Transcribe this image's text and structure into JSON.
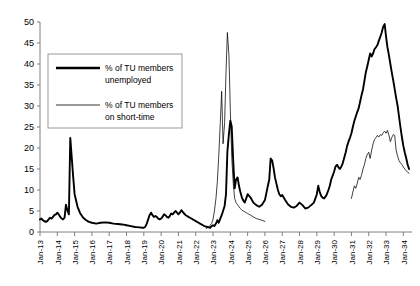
{
  "chart_data": {
    "type": "line",
    "title": "",
    "xlabel": "",
    "ylabel": "",
    "ylim": [
      0,
      50
    ],
    "ytick_step": 5,
    "grid": false,
    "legend_position": "upper-left-inside",
    "ytick_labels": [
      "0",
      "5",
      "10",
      "15",
      "20",
      "25",
      "30",
      "35",
      "40",
      "45",
      "50"
    ],
    "xtick_labels": [
      "Jan-13",
      "Jan-14",
      "Jan-15",
      "Jan-16",
      "Jan-17",
      "Jan-18",
      "Jan-19",
      "Jan-20",
      "Jan-21",
      "Jan-22",
      "Jan-23",
      "Jan-24",
      "Jan-25",
      "Jan-26",
      "Jan-27",
      "Jan-28",
      "Jan-29",
      "Jan-30",
      "Jan-31",
      "Jan-32",
      "Jan-33",
      "Jan-34"
    ],
    "x_start": 1913.0,
    "x_end": 1934.5,
    "series": [
      {
        "name": "% of TU members unemployed",
        "style": "thick",
        "color": "#000000",
        "x": [
          1913.0,
          1913.08,
          1913.17,
          1913.25,
          1913.33,
          1913.42,
          1913.5,
          1913.58,
          1913.67,
          1913.75,
          1913.83,
          1913.92,
          1914.0,
          1914.08,
          1914.17,
          1914.25,
          1914.33,
          1914.42,
          1914.5,
          1914.58,
          1914.67,
          1914.75,
          1914.83,
          1914.92,
          1915.0,
          1915.17,
          1915.33,
          1915.5,
          1915.67,
          1915.83,
          1916.0,
          1916.25,
          1916.5,
          1916.75,
          1917.0,
          1917.25,
          1917.5,
          1917.75,
          1918.0,
          1918.25,
          1918.5,
          1918.75,
          1918.92,
          1919.0,
          1919.08,
          1919.17,
          1919.25,
          1919.33,
          1919.42,
          1919.5,
          1919.58,
          1919.67,
          1919.75,
          1919.83,
          1919.92,
          1920.0,
          1920.08,
          1920.17,
          1920.25,
          1920.33,
          1920.42,
          1920.5,
          1920.58,
          1920.67,
          1920.75,
          1920.83,
          1920.92,
          1921.0,
          1921.08,
          1921.17,
          1921.25,
          1921.33,
          1921.42,
          1921.5,
          1921.58,
          1921.67,
          1921.75,
          1921.83,
          1921.92,
          1922.0,
          1922.08,
          1922.17,
          1922.25,
          1922.33,
          1922.42,
          1922.5,
          1922.58,
          1922.67,
          1922.75,
          1922.83,
          1922.92,
          1923.0,
          1923.08,
          1923.17,
          1923.25,
          1923.33,
          1923.42,
          1923.5,
          1923.58,
          1923.67,
          1923.75,
          1923.83,
          1923.92,
          1924.0,
          1924.08,
          1924.17,
          1924.25,
          1924.33,
          1924.42,
          1924.5,
          1924.58,
          1924.67,
          1924.75,
          1924.83,
          1924.92,
          1925.0,
          1925.17,
          1925.33,
          1925.5,
          1925.67,
          1925.83,
          1926.0,
          1926.08,
          1926.17,
          1926.25,
          1926.33,
          1926.42,
          1926.5,
          1926.58,
          1926.67,
          1926.75,
          1926.83,
          1926.92,
          1927.0,
          1927.17,
          1927.33,
          1927.5,
          1927.67,
          1927.83,
          1928.0,
          1928.17,
          1928.33,
          1928.5,
          1928.67,
          1928.83,
          1929.0,
          1929.08,
          1929.17,
          1929.25,
          1929.33,
          1929.42,
          1929.5,
          1929.58,
          1929.67,
          1929.75,
          1929.83,
          1929.92,
          1930.0,
          1930.08,
          1930.17,
          1930.25,
          1930.33,
          1930.42,
          1930.5,
          1930.58,
          1930.67,
          1930.75,
          1930.83,
          1930.92,
          1931.0,
          1931.08,
          1931.17,
          1931.25,
          1931.33,
          1931.42,
          1931.5,
          1931.58,
          1931.67,
          1931.75,
          1931.83,
          1931.92,
          1932.0,
          1932.08,
          1932.17,
          1932.25,
          1932.33,
          1932.42,
          1932.5,
          1932.58,
          1932.67,
          1932.75,
          1932.83,
          1932.92,
          1933.0,
          1933.08,
          1933.17,
          1933.25,
          1933.33,
          1933.42,
          1933.5,
          1933.58,
          1933.67,
          1933.75,
          1933.83,
          1933.92,
          1934.0,
          1934.08,
          1934.17,
          1934.25,
          1934.33
        ],
        "values": [
          3.0,
          3.2,
          2.8,
          2.6,
          2.4,
          2.6,
          3.0,
          3.4,
          3.2,
          3.6,
          4.0,
          4.2,
          4.6,
          4.2,
          3.6,
          3.2,
          3.0,
          3.4,
          6.5,
          5.2,
          4.2,
          22.4,
          18.0,
          13.0,
          9.0,
          6.0,
          4.4,
          3.4,
          2.8,
          2.4,
          2.2,
          2.0,
          2.2,
          2.3,
          2.2,
          2.0,
          1.9,
          1.8,
          1.6,
          1.4,
          1.2,
          1.1,
          1.0,
          1.0,
          1.2,
          2.0,
          3.0,
          4.0,
          4.6,
          4.0,
          3.6,
          3.8,
          3.6,
          3.2,
          3.0,
          3.2,
          3.6,
          4.2,
          4.0,
          3.6,
          3.4,
          3.8,
          4.4,
          4.2,
          4.6,
          5.0,
          4.6,
          4.2,
          4.6,
          5.2,
          4.8,
          4.4,
          4.0,
          3.8,
          3.6,
          3.4,
          3.2,
          3.0,
          2.8,
          2.6,
          2.4,
          2.2,
          2.0,
          1.8,
          1.6,
          1.4,
          1.3,
          1.2,
          1.1,
          1.0,
          1.4,
          1.6,
          1.4,
          2.0,
          2.8,
          2.2,
          3.2,
          4.0,
          5.0,
          6.2,
          9.0,
          19.1,
          23.4,
          26.5,
          25.1,
          16.6,
          10.4,
          12.5,
          13.0,
          11.0,
          9.5,
          8.2,
          7.5,
          7.0,
          8.0,
          9.0,
          8.2,
          7.0,
          6.4,
          6.0,
          6.5,
          7.6,
          9.2,
          11.0,
          12.5,
          17.5,
          17.0,
          15.2,
          13.0,
          11.4,
          10.0,
          9.0,
          8.5,
          8.8,
          7.6,
          6.6,
          6.0,
          5.8,
          6.2,
          7.0,
          6.4,
          5.6,
          5.8,
          6.4,
          7.0,
          9.0,
          11.0,
          9.5,
          8.6,
          8.2,
          8.0,
          8.4,
          9.0,
          10.0,
          11.0,
          12.5,
          13.5,
          14.4,
          15.6,
          16.0,
          15.4,
          15.0,
          15.6,
          16.4,
          17.6,
          19.0,
          20.5,
          21.5,
          22.5,
          23.5,
          25.0,
          26.5,
          27.5,
          28.5,
          29.5,
          31.0,
          32.5,
          34.0,
          36.0,
          38.0,
          39.5,
          41.0,
          42.5,
          41.8,
          42.5,
          43.5,
          44.0,
          44.5,
          45.5,
          46.5,
          47.5,
          48.8,
          49.5,
          46.5,
          44.0,
          42.0,
          40.0,
          38.0,
          36.0,
          34.0,
          32.0,
          30.0,
          27.5,
          25.0,
          22.5,
          20.5,
          19.0,
          17.5,
          16.0,
          15.0
        ]
      },
      {
        "name": "% of TU members on short-time",
        "style": "thin",
        "color": "#000000",
        "segments": [
          {
            "x": [
              1922.6,
              1922.75,
              1922.83,
              1922.92,
              1923.0,
              1923.08,
              1923.17,
              1923.25,
              1923.33,
              1923.42,
              1923.5,
              1923.58,
              1923.67,
              1923.75,
              1923.83,
              1923.92,
              1924.0,
              1924.08,
              1924.17,
              1924.25,
              1924.33,
              1924.42,
              1924.5,
              1924.58,
              1924.67,
              1924.75,
              1924.83,
              1924.92,
              1925.0,
              1925.17,
              1925.33,
              1925.5,
              1925.67,
              1925.83,
              1926.0
            ],
            "values": [
              0.8,
              1.2,
              1.6,
              2.0,
              3.0,
              5.0,
              8.0,
              12.0,
              18.0,
              26.0,
              33.5,
              21.0,
              26.0,
              38.0,
              47.5,
              42.0,
              29.0,
              18.0,
              11.5,
              8.0,
              7.0,
              6.5,
              6.0,
              5.6,
              5.2,
              5.0,
              4.8,
              4.6,
              4.4,
              4.0,
              3.6,
              3.2,
              3.0,
              2.8,
              2.5
            ]
          },
          {
            "x": [
              1931.0,
              1931.08,
              1931.17,
              1931.25,
              1931.33,
              1931.42,
              1931.5,
              1931.58,
              1931.67,
              1931.75,
              1931.83,
              1931.92,
              1932.0,
              1932.08,
              1932.17,
              1932.25,
              1932.33,
              1932.42,
              1932.5,
              1932.58,
              1932.67,
              1932.75,
              1932.83,
              1932.92,
              1933.0,
              1933.08,
              1933.17,
              1933.25,
              1933.33,
              1933.42,
              1933.5,
              1933.58,
              1933.67,
              1933.75,
              1933.83,
              1933.92,
              1934.0,
              1934.08,
              1934.17,
              1934.25,
              1934.33
            ],
            "values": [
              8.0,
              9.5,
              11.0,
              10.4,
              11.5,
              13.0,
              12.5,
              13.5,
              15.0,
              16.0,
              17.5,
              18.5,
              19.0,
              17.5,
              19.5,
              21.0,
              22.0,
              22.5,
              23.0,
              22.6,
              23.2,
              23.0,
              23.6,
              24.0,
              23.5,
              24.2,
              23.0,
              21.5,
              22.5,
              23.2,
              23.0,
              19.5,
              18.0,
              17.0,
              16.5,
              16.0,
              15.5,
              15.0,
              14.6,
              14.2,
              14.0
            ]
          }
        ]
      }
    ]
  },
  "legend": {
    "entries": [
      {
        "line1": "% of TU members",
        "line2": "unemployed",
        "style": "thick"
      },
      {
        "line1": "% of TU members",
        "line2": "on short-time",
        "style": "thin"
      }
    ]
  },
  "colors": {
    "axis": "#808080",
    "series": "#000000",
    "background": "#ffffff",
    "legend_border": "#9a9a9a"
  }
}
